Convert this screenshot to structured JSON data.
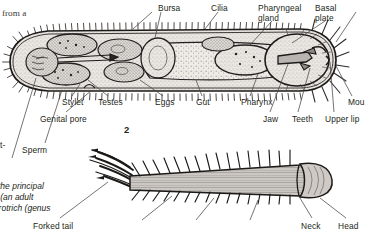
{
  "page": {
    "width": 367,
    "height": 233,
    "background": "#ffffff",
    "ink": "#231f20"
  },
  "body_text": {
    "clipped_line_top": "from a",
    "clipped_fragment_left": "t-"
  },
  "figure_1": {
    "number": "",
    "subject": "gastrotrich internal anatomy, lateral view",
    "labels_top": [
      {
        "text": "Bursa",
        "x": 158,
        "y": 4
      },
      {
        "text": "Cilia",
        "x": 211,
        "y": 4
      },
      {
        "text": "Pharyngeal",
        "x": 258,
        "y": 4
      },
      {
        "text": "gland",
        "x": 258,
        "y": 13
      },
      {
        "text": "Basal",
        "x": 315,
        "y": 4
      },
      {
        "text": "plate",
        "x": 315,
        "y": 13
      }
    ],
    "labels_bottom": [
      {
        "text": "Stylet",
        "x": 62,
        "y": 98
      },
      {
        "text": "Testes",
        "x": 98,
        "y": 98
      },
      {
        "text": "Eggs",
        "x": 155,
        "y": 98
      },
      {
        "text": "Gut",
        "x": 196,
        "y": 98
      },
      {
        "text": "Pharynx",
        "x": 241,
        "y": 98
      },
      {
        "text": "Mou",
        "x": 348,
        "y": 98
      },
      {
        "text": "Genital pore",
        "x": 40,
        "y": 115
      },
      {
        "text": "Jaw",
        "x": 263,
        "y": 115
      },
      {
        "text": "Teeth",
        "x": 292,
        "y": 115
      },
      {
        "text": "Upper lip",
        "x": 325,
        "y": 115
      },
      {
        "text": "Sperm",
        "x": 22,
        "y": 146
      }
    ]
  },
  "figure_2": {
    "number": "2",
    "subject": "gastrotrich whole body, dorsal view",
    "labels": [
      {
        "text": "Forked tail",
        "x": 33,
        "y": 223
      },
      {
        "text": "Neck",
        "x": 301,
        "y": 223
      },
      {
        "text": "Head",
        "x": 338,
        "y": 223
      }
    ]
  },
  "caption": {
    "lines": [
      "the principal",
      "l (an adult",
      "strotrich (genus"
    ]
  }
}
